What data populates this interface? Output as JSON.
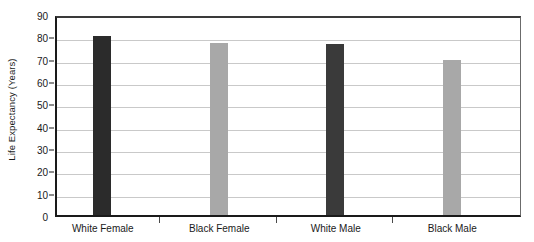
{
  "chart_data": {
    "type": "bar",
    "title": "",
    "xlabel": "",
    "ylabel": "Life Expectancy (Years)",
    "categories": [
      "White Female",
      "Black Female",
      "White Male",
      "Black Male"
    ],
    "values": [
      80,
      77,
      76.5,
      69.5
    ],
    "series": [
      {
        "name": "Life Expectancy",
        "values": [
          80,
          77,
          76.5,
          69.5
        ],
        "colors": [
          "#2b2b2b",
          "#a8a8a8",
          "#3a3a3a",
          "#a8a8a8"
        ]
      }
    ],
    "ylim": [
      0,
      90
    ],
    "ytick_step": 10,
    "yticks": [
      "90",
      "80",
      "70",
      "60",
      "50",
      "40",
      "30",
      "20",
      "10",
      "0"
    ],
    "ytick_values": [
      90,
      80,
      70,
      60,
      50,
      40,
      30,
      20,
      10,
      0
    ],
    "grid": true,
    "grid_axis": "y",
    "legend": "none",
    "bar_colors": {
      "dark": "#2b2b2b",
      "gray": "#a8a8a8"
    },
    "axis_color": "#1a1a1a",
    "gridline_color": "#c9c9c9",
    "background_color": "#ffffff"
  }
}
